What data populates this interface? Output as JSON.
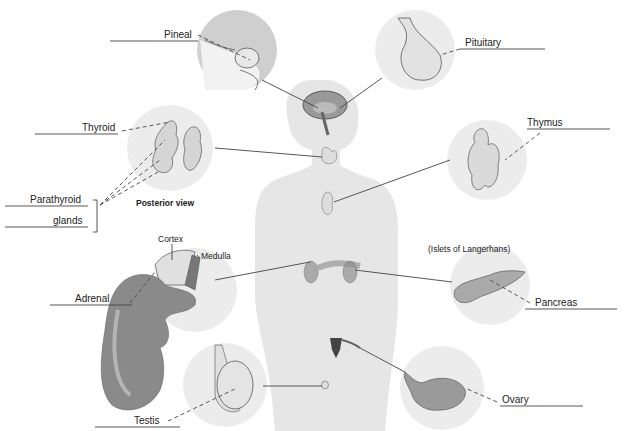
{
  "diagram": {
    "labels": {
      "pineal": "Pineal",
      "pituitary": "Pituitary",
      "thyroid": "Thyroid",
      "thymus": "Thymus",
      "parathyroid": "Parathyroid",
      "glands": "glands",
      "posterior_view": "Posterior view",
      "cortex": "Cortex",
      "medulla": "Medulla",
      "adrenal": "Adrenal",
      "islets": "(Islets of Langerhans)",
      "pancreas": "Pancreas",
      "testis": "Testis",
      "ovary": "Ovary"
    },
    "colors": {
      "body_silhouette": "#e6e6e6",
      "inset_circle": "#ececec",
      "organ_fill": "#cfcfcf",
      "kidney_fill": "#8a8a8a",
      "line": "#444444"
    }
  }
}
